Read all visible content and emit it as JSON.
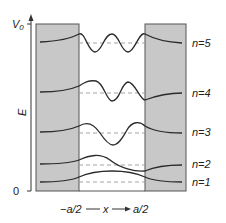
{
  "diagram": {
    "y_axis_label": "E",
    "y_top_label": "V0",
    "y_top_label_main": "V",
    "y_top_label_sub": "0",
    "y_bottom_label": "0",
    "x_axis_left": "−a/2",
    "x_axis_var": "x",
    "x_axis_right": "a/2",
    "levels": [
      {
        "n": 1,
        "label": "n=1"
      },
      {
        "n": 2,
        "label": "n=2"
      },
      {
        "n": 3,
        "label": "n=3"
      },
      {
        "n": 4,
        "label": "n=4"
      },
      {
        "n": 5,
        "label": "n=5"
      }
    ],
    "colors": {
      "barrier": "#c8c8c8",
      "curve": "#2a2a2a",
      "dashed": "#999999",
      "axis": "#333333"
    }
  }
}
